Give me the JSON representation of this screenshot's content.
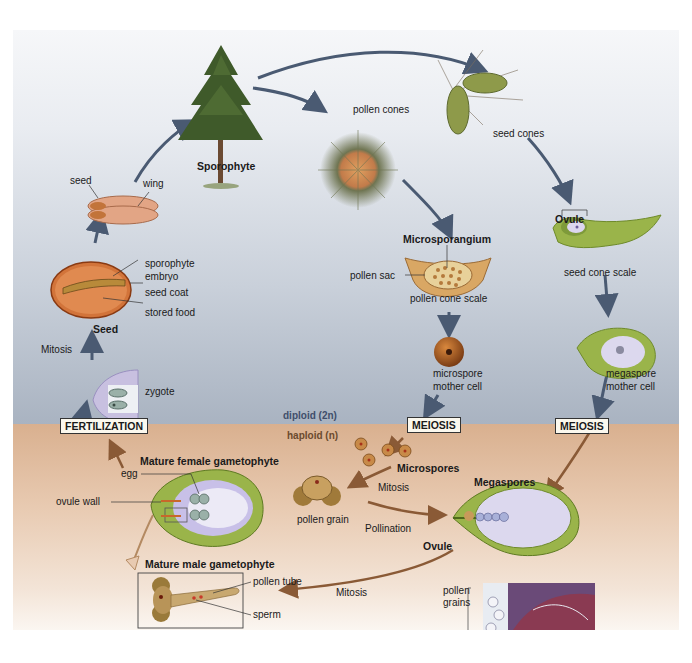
{
  "diagram": {
    "colors": {
      "diploid_band": "#b4bdca",
      "haploid_band": "#dcb592",
      "diploid_arrow": "#4a5a72",
      "haploid_arrow": "#8a5a36",
      "diploid_label": "#3f4e6b",
      "haploid_label": "#6b4a2e"
    },
    "ploidy": {
      "diploid": "diploid (2n)",
      "haploid": "haploid (n)"
    },
    "stages": {
      "sporophyte": "Sporophyte",
      "pollen_cones": "pollen cones",
      "seed_cones": "seed cones",
      "microsporangium": "Microsporangium",
      "pollen_sac": "pollen sac",
      "pollen_cone_scale": "pollen cone scale",
      "microspore_mother_cell": [
        "microspore",
        "mother cell"
      ],
      "ovule_top": "Ovule",
      "seed_cone_scale": "seed cone scale",
      "megaspore_mother_cell": [
        "megaspore",
        "mother cell"
      ],
      "meiosis_left": "MEIOSIS",
      "meiosis_right": "MEIOSIS",
      "microspores": "Microspores",
      "mitosis_pollen": "Mitosis",
      "pollen_grain": "pollen grain",
      "pollination": "Pollination",
      "megaspores": "Megaspores",
      "ovule_bottom": "Ovule",
      "micrograph_label": [
        "pollen",
        "grains"
      ],
      "micrograph_scale": "100×",
      "mitosis_male": "Mitosis",
      "mature_male": "Mature male gametophyte",
      "pollen_tube": "pollen tube",
      "sperm": "sperm",
      "mature_female": "Mature female gametophyte",
      "egg": "egg",
      "ovule_wall": "ovule wall",
      "fertilization": "FERTILIZATION",
      "zygote": "zygote",
      "mitosis_seed": "Mitosis",
      "seed": "Seed",
      "sporophyte_embryo": [
        "sporophyte",
        "embryo"
      ],
      "seed_coat": "seed coat",
      "stored_food": "stored food",
      "seed_small": "seed",
      "wing": "wing"
    }
  }
}
